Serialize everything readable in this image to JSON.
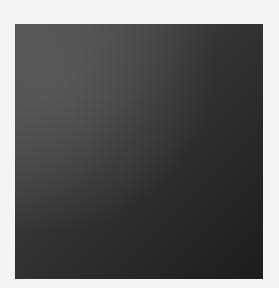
{
  "image": {
    "background_color": "#f4f4f4",
    "swatch": {
      "gradient_start_color": "#595959",
      "gradient_mid_color": "#333333",
      "gradient_end_color": "#1c1c1c",
      "gradient_direction": "135deg",
      "highlight_position": "top-left"
    }
  }
}
